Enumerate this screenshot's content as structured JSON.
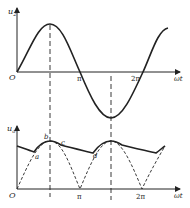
{
  "top_plot": {
    "y_label_main": "u",
    "y_label_sub": "2",
    "origin": "O",
    "x_label": "ωt",
    "ticks": [
      "π",
      "2π"
    ],
    "waveform": "sine"
  },
  "bottom_plot": {
    "y_label_main": "u",
    "y_label_sub": "o",
    "origin": "O",
    "x_label": "ωt",
    "ticks": [
      "π",
      "2π"
    ],
    "points": [
      "a",
      "b",
      "c",
      "d"
    ],
    "waveform": "full-wave rectified with capacitor filter (dashed = rectified sine, solid = output)"
  },
  "colors": {
    "stroke": "#222222",
    "background": "#ffffff"
  }
}
